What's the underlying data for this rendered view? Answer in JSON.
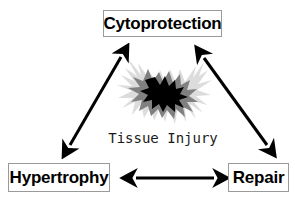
{
  "diagram": {
    "background_color": "#ffffff",
    "nodes": [
      {
        "id": "cytoprotection",
        "label": "Cytoprotection",
        "position": "top-center",
        "border_color": "#9a9a9a",
        "text_color": "#000000"
      },
      {
        "id": "hypertrophy",
        "label": "Hypertrophy",
        "position": "bottom-left",
        "border_color": "#9a9a9a",
        "text_color": "#000000"
      },
      {
        "id": "repair",
        "label": "Repair",
        "position": "bottom-right",
        "border_color": "#9a9a9a",
        "text_color": "#000000"
      }
    ],
    "center": {
      "label": "Tissue Injury",
      "graphic": "starburst-explosion-icon",
      "colors": {
        "outer_spikes": "#dcdcdc",
        "mid_burst": "#808080",
        "core": "#000000"
      }
    },
    "connectors": [
      {
        "id": "hypertrophy-cytoprotection",
        "from": "hypertrophy",
        "to": "cytoprotection",
        "style": "double-headed-arrow",
        "color": "#000000"
      },
      {
        "id": "cytoprotection-repair",
        "from": "cytoprotection",
        "to": "repair",
        "style": "double-headed-arrow",
        "color": "#000000"
      },
      {
        "id": "hypertrophy-repair",
        "from": "hypertrophy",
        "to": "repair",
        "style": "double-headed-arrow",
        "color": "#000000"
      }
    ]
  }
}
